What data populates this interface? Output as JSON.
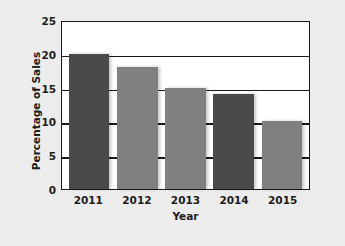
{
  "chart_data": {
    "type": "bar",
    "title": "",
    "xlabel": "Year",
    "ylabel": "Percentage of Sales",
    "categories": [
      "2011",
      "2012",
      "2013",
      "2014",
      "2015"
    ],
    "values": [
      20,
      18,
      15,
      14,
      10
    ],
    "bar_colors": [
      "#4a4a4a",
      "#808080",
      "#808080",
      "#4a4a4a",
      "#808080"
    ],
    "ylim": [
      0,
      25
    ],
    "ytick_labels": [
      "0",
      "5",
      "10",
      "15",
      "20",
      "25"
    ],
    "ytick_values": [
      0,
      5,
      10,
      15,
      20,
      25
    ],
    "grid": true,
    "legend": "none",
    "plot_background": "#ffffff",
    "page_background": "#ececec",
    "axis_color": "#1a1a1a"
  }
}
